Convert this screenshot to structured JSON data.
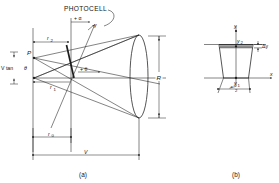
{
  "figure": {
    "caption_a": "(a)",
    "caption_b": "(b)",
    "panel_a": {
      "title_label": "PHOTOCELL",
      "labels": {
        "point_p": "P",
        "v_tan_theta": "V tan",
        "theta_sym": "θ",
        "alpha": "+ α",
        "gamma": "γ",
        "theta_center": "+ θ",
        "r2": "r",
        "r2_sub": "2",
        "r1": "r",
        "r1_sub": "1",
        "r0": "r",
        "r0_sub": "0",
        "R": "R",
        "V": "V"
      }
    },
    "panel_b": {
      "labels": {
        "y_axis": "y",
        "x_axis": "x",
        "y2": "y",
        "y2_sub": "2",
        "y1": "y",
        "y1_sub": "1",
        "delta_y": "Δy",
        "width_num": "x",
        "width_den": "2"
      }
    },
    "colors": {
      "ink": "#1d1d1d",
      "hatch": "#8d8d8d",
      "background": "#ffffff"
    }
  }
}
